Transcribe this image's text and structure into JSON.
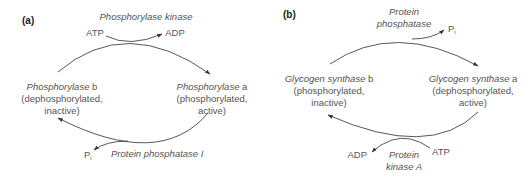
{
  "panel_a": {
    "label": "(a)",
    "enzyme_top": "Phosphorylase kinase",
    "top_in": "ATP",
    "top_out": "ADP",
    "left_state": {
      "name_italic": "Phosphorylase",
      "name_suffix": " b",
      "line2": "(dephosphorylated,",
      "line3": "inactive)"
    },
    "right_state": {
      "name_italic": "Phosphorylase",
      "name_suffix": " a",
      "line2": "(phosphorylated,",
      "line3": "active)"
    },
    "bottom_out": "P",
    "bottom_out_sub": "i",
    "enzyme_bottom": "Protein phosphatase I"
  },
  "panel_b": {
    "label": "(b)",
    "enzyme_top_line1": "Protein",
    "enzyme_top_line2": "phosphatase",
    "top_out": "P",
    "top_out_sub": "i",
    "left_state": {
      "name_italic": "Glycogen synthase",
      "name_suffix": " b",
      "line2": "(phosphorylated,",
      "line3": "inactive)"
    },
    "right_state": {
      "name_italic": "Glycogen synthase",
      "name_suffix": " a",
      "line2": "(dephosphorylated,",
      "line3": "active)"
    },
    "bottom_out": "ADP",
    "bottom_in": "ATP",
    "enzyme_bottom_line1": "Protein",
    "enzyme_bottom_line2": "kinase A"
  },
  "colors": {
    "text": "#555555",
    "stroke": "#444444",
    "background": "#ffffff"
  }
}
